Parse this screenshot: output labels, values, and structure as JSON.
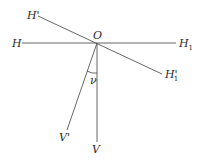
{
  "diagram": {
    "points": {
      "origin": {
        "label": "O",
        "x": 97,
        "y": 43
      }
    },
    "lines": [
      {
        "id": "H-H1",
        "from": [
          22,
          43
        ],
        "to": [
          176,
          43
        ],
        "start_label": "H",
        "end_label": "H",
        "end_sub": "1"
      },
      {
        "id": "H'-H1'",
        "from": [
          38,
          16
        ],
        "to": [
          162,
          74
        ],
        "start_label": "H'",
        "end_label": "H'",
        "end_sub": "1"
      },
      {
        "id": "O-V",
        "from": [
          97,
          43
        ],
        "to": [
          97,
          142
        ],
        "end_label": "V"
      },
      {
        "id": "O-V'",
        "from": [
          97,
          43
        ],
        "to": [
          67,
          130
        ],
        "end_label": "V'"
      }
    ],
    "angle": {
      "label": "ν",
      "between": [
        "O-V'",
        "O-V"
      ]
    },
    "labels": {
      "O": "O",
      "H": "H",
      "H1": "H",
      "H1_sub": "1",
      "Hprime": "H'",
      "H1prime": "H'",
      "H1prime_sub": "1",
      "V": "V",
      "Vprime": "V'",
      "nu": "ν"
    },
    "colors": {
      "line": "#555555",
      "text": "#2a2a2a",
      "background": "#ffffff"
    }
  }
}
